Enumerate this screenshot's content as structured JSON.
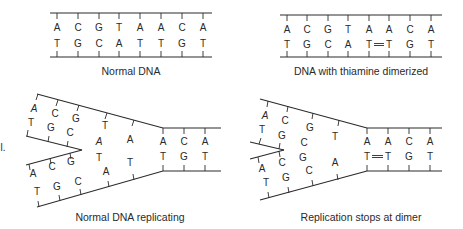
{
  "panels": {
    "normal_dna": {
      "caption": "Normal DNA",
      "top_strand": [
        "A",
        "C",
        "G",
        "T",
        "A",
        "A",
        "C",
        "A"
      ],
      "bottom_strand": [
        "T",
        "G",
        "C",
        "A",
        "T",
        "T",
        "G",
        "T"
      ]
    },
    "dimerized_dna": {
      "caption": "DNA with thiamine dimerized",
      "top_strand": [
        "A",
        "C",
        "G",
        "T",
        "A",
        "A",
        "C",
        "A"
      ],
      "bottom_strand": [
        "T",
        "G",
        "C",
        "A",
        "T",
        "T",
        "G",
        "T"
      ],
      "dimer_between": [
        "T",
        "T"
      ]
    },
    "normal_replicating": {
      "caption": "Normal DNA replicating",
      "side_label": "l.",
      "upper_arm": {
        "outer": [
          "A",
          "C",
          "G",
          "T",
          "A"
        ],
        "inner": [
          "T",
          "G",
          "C"
        ]
      },
      "lower_arm": {
        "inner": [
          "A",
          "C",
          "G"
        ],
        "outer": [
          "T",
          "G",
          "C",
          "A",
          "T"
        ]
      },
      "free_middle": [
        "A",
        "T"
      ],
      "duplex_top": [
        "A",
        "C",
        "A"
      ],
      "duplex_bottom": [
        "T",
        "G",
        "T"
      ]
    },
    "replication_stops": {
      "caption": "Replication stops at dimer",
      "upper_arm": {
        "outer": [
          "A",
          "C",
          "G",
          "T"
        ],
        "inner": [
          "T",
          "G"
        ]
      },
      "lower_arm": {
        "inner": [
          "A",
          "C"
        ],
        "outer": [
          "T",
          "G",
          "C",
          "A"
        ]
      },
      "free_middle": [
        "C",
        "G"
      ],
      "duplex_top": [
        "A",
        "A",
        "C",
        "A"
      ],
      "duplex_bottom": [
        "T",
        "T",
        "G",
        "T"
      ],
      "dimer_between": [
        "T",
        "T"
      ]
    }
  }
}
